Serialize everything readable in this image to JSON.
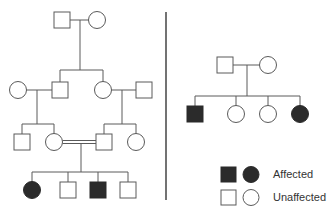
{
  "diagram": {
    "type": "pedigree",
    "colors": {
      "line": "#5a5a5a",
      "affected_fill": "#2b2b2b",
      "unaffected_fill": "#ffffff",
      "divider": "#444444"
    },
    "left_pedigree": {
      "generation_I": [
        {
          "sex": "male",
          "affected": false
        },
        {
          "sex": "female",
          "affected": false
        }
      ],
      "generation_II": [
        {
          "sex": "female",
          "affected": false,
          "note": "spouse"
        },
        {
          "sex": "male",
          "affected": false
        },
        {
          "sex": "female",
          "affected": false
        },
        {
          "sex": "male",
          "affected": false,
          "note": "spouse"
        }
      ],
      "generation_III": [
        {
          "sex": "male",
          "affected": false
        },
        {
          "sex": "female",
          "affected": false,
          "note": "consanguineous mating"
        },
        {
          "sex": "male",
          "affected": false,
          "note": "consanguineous mating"
        },
        {
          "sex": "female",
          "affected": false
        }
      ],
      "generation_IV": [
        {
          "sex": "female",
          "affected": true
        },
        {
          "sex": "male",
          "affected": false
        },
        {
          "sex": "male",
          "affected": true
        },
        {
          "sex": "male",
          "affected": false
        }
      ]
    },
    "right_pedigree": {
      "parents": [
        {
          "sex": "male",
          "affected": false
        },
        {
          "sex": "female",
          "affected": false
        }
      ],
      "children": [
        {
          "sex": "male",
          "affected": true
        },
        {
          "sex": "female",
          "affected": false
        },
        {
          "sex": "female",
          "affected": false
        },
        {
          "sex": "female",
          "affected": true
        }
      ]
    },
    "legend": {
      "affected_label": "Affected",
      "unaffected_label": "Unaffected"
    }
  }
}
